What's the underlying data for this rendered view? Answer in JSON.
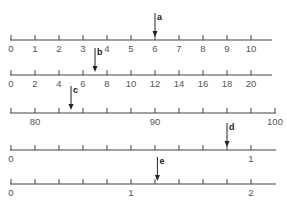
{
  "diagram": {
    "title": "",
    "colors": {
      "line": "#444444",
      "label": "#555555",
      "arrow": "#222222"
    },
    "number_lines": [
      {
        "id": "line-1",
        "y": 40,
        "x_start": 10,
        "x_end": 272,
        "ticks": [
          0,
          1,
          2,
          3,
          4,
          5,
          6,
          7,
          8,
          9,
          10
        ],
        "tick_x0": 11,
        "tick_spacing": 24,
        "labels": [
          {
            "text": "0",
            "tick": 0
          },
          {
            "text": "1",
            "tick": 1
          },
          {
            "text": "2",
            "tick": 2
          },
          {
            "text": "3",
            "tick": 3
          },
          {
            "text": "4",
            "tick": 4
          },
          {
            "text": "5",
            "tick": 5
          },
          {
            "text": "6",
            "tick": 6
          },
          {
            "text": "7",
            "tick": 7
          },
          {
            "text": "8",
            "tick": 8
          },
          {
            "text": "9",
            "tick": 9
          },
          {
            "text": "10",
            "tick": 10
          }
        ],
        "tick_count": 11,
        "arrow": {
          "label": "a",
          "tick_pos": 6,
          "value": 6
        }
      },
      {
        "id": "line-2",
        "y": 75,
        "x_start": 10,
        "x_end": 272,
        "tick_x0": 11,
        "tick_spacing": 24,
        "labels": [
          {
            "text": "0",
            "tick": 0
          },
          {
            "text": "2",
            "tick": 1
          },
          {
            "text": "4",
            "tick": 2
          },
          {
            "text": "6",
            "tick": 3
          },
          {
            "text": "8",
            "tick": 4
          },
          {
            "text": "10",
            "tick": 5
          },
          {
            "text": "12",
            "tick": 6
          },
          {
            "text": "14",
            "tick": 7
          },
          {
            "text": "16",
            "tick": 8
          },
          {
            "text": "18",
            "tick": 9
          },
          {
            "text": "20",
            "tick": 10
          }
        ],
        "tick_count": 11,
        "arrow": {
          "label": "b",
          "tick_pos": 3.5,
          "value": 7
        }
      },
      {
        "id": "line-3",
        "y": 113,
        "x_start": 10,
        "x_end": 276,
        "tick_x0": 11,
        "tick_spacing": 24,
        "labels": [
          {
            "text": "80",
            "tick": 1
          },
          {
            "text": "90",
            "tick": 6
          },
          {
            "text": "100",
            "tick": 11
          }
        ],
        "tick_count": 12,
        "arrow": {
          "label": "c",
          "tick_pos": 2.5,
          "value": 83
        }
      },
      {
        "id": "line-4",
        "y": 150,
        "x_start": 10,
        "x_end": 276,
        "tick_x0": 11,
        "tick_spacing": 24,
        "labels": [
          {
            "text": "0",
            "tick": 0
          },
          {
            "text": "1",
            "tick": 10
          }
        ],
        "tick_count": 11,
        "arrow": {
          "label": "d",
          "tick_pos": 9,
          "value": 0.9
        }
      },
      {
        "id": "line-5",
        "y": 184,
        "x_start": 10,
        "x_end": 276,
        "tick_x0": 11,
        "tick_spacing": 24,
        "labels": [
          {
            "text": "0",
            "tick": 0
          },
          {
            "text": "1",
            "tick": 5
          },
          {
            "text": "2",
            "tick": 10
          }
        ],
        "tick_count": 11,
        "arrow": {
          "label": "e",
          "tick_pos": 6.1,
          "value": 1.2
        }
      }
    ]
  }
}
